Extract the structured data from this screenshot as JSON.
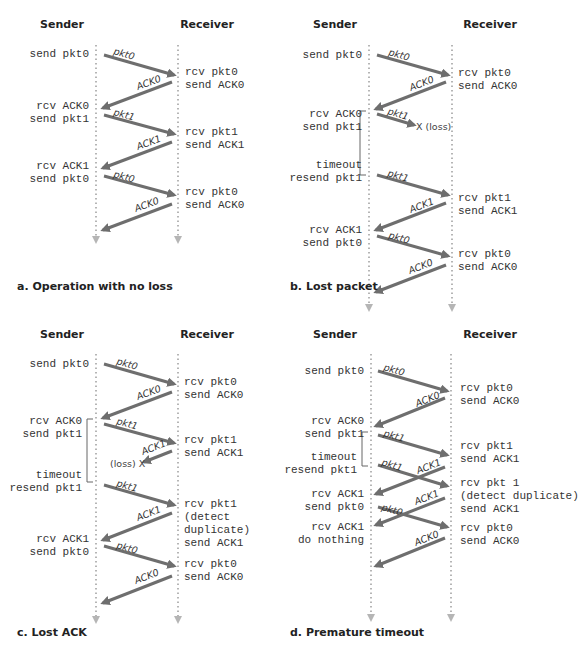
{
  "colors": {
    "arrow": "#6e6e6e",
    "timeline": "#b5b5b5",
    "text": "#333333"
  },
  "panels": [
    {
      "id": "a",
      "caption": "a. Operation with no loss",
      "sender_header": "Sender",
      "receiver_header": "Receiver",
      "header_pos": {
        "sender_x": 62,
        "receiver_x": 207,
        "y": 28
      },
      "timeline": {
        "sender_x": 96,
        "receiver_x": 178,
        "y1": 45,
        "y2": 240
      },
      "caption_pos": {
        "x": 17,
        "y": 290
      },
      "sender_events": [
        {
          "lines": [
            "send pkt0"
          ],
          "x": 89,
          "y": 57
        },
        {
          "lines": [
            "rcv ACK0",
            "send pkt1"
          ],
          "x": 89,
          "y": 109
        },
        {
          "lines": [
            "rcv ACK1",
            "send pkt0"
          ],
          "x": 89,
          "y": 169
        }
      ],
      "receiver_events": [
        {
          "lines": [
            "rcv pkt0",
            "send ACK0"
          ],
          "x": 185,
          "y": 75
        },
        {
          "lines": [
            "rcv pkt1",
            "send ACK1"
          ],
          "x": 185,
          "y": 135
        },
        {
          "lines": [
            "rcv pkt0",
            "send ACK0"
          ],
          "x": 185,
          "y": 195
        }
      ],
      "arrows": [
        {
          "label": "pkt0",
          "x1": 104,
          "y1": 55,
          "x2": 174,
          "y2": 75,
          "lx": 113,
          "ly": 54
        },
        {
          "label": "ACK0",
          "x1": 172,
          "y1": 82,
          "x2": 103,
          "y2": 108,
          "lx": 138,
          "ly": 90
        },
        {
          "label": "pkt1",
          "x1": 104,
          "y1": 115,
          "x2": 174,
          "y2": 134,
          "lx": 113,
          "ly": 115
        },
        {
          "label": "ACK1",
          "x1": 172,
          "y1": 142,
          "x2": 103,
          "y2": 168,
          "lx": 138,
          "ly": 150
        },
        {
          "label": "pkt0",
          "x1": 104,
          "y1": 176,
          "x2": 174,
          "y2": 195,
          "lx": 113,
          "ly": 177
        },
        {
          "label": "ACK0",
          "x1": 172,
          "y1": 204,
          "x2": 103,
          "y2": 230,
          "lx": 136,
          "ly": 212
        }
      ],
      "losses": [],
      "brackets": []
    },
    {
      "id": "b",
      "caption": "b. Lost packet",
      "sender_header": "Sender",
      "receiver_header": "Receiver",
      "header_pos": {
        "sender_x": 335,
        "receiver_x": 490,
        "y": 28
      },
      "timeline": {
        "sender_x": 369,
        "receiver_x": 452,
        "y1": 45,
        "y2": 308
      },
      "caption_pos": {
        "x": 290,
        "y": 290
      },
      "sender_events": [
        {
          "lines": [
            "send pkt0"
          ],
          "x": 362,
          "y": 58
        },
        {
          "lines": [
            "rcv ACK0",
            "send pkt1"
          ],
          "x": 362,
          "y": 117
        },
        {
          "lines": [
            "timeout",
            "resend pkt1"
          ],
          "x": 362,
          "y": 168
        },
        {
          "lines": [
            "rcv ACK1",
            "send pkt0"
          ],
          "x": 362,
          "y": 233
        }
      ],
      "receiver_events": [
        {
          "lines": [
            "rcv pkt0",
            "send ACK0"
          ],
          "x": 458,
          "y": 76
        },
        {
          "lines": [
            "rcv pkt1",
            "send ACK1"
          ],
          "x": 458,
          "y": 201
        },
        {
          "lines": [
            "rcv pkt0",
            "send ACK0"
          ],
          "x": 458,
          "y": 257
        }
      ],
      "arrows": [
        {
          "label": "pkt0",
          "x1": 377,
          "y1": 55,
          "x2": 448,
          "y2": 75,
          "lx": 388,
          "ly": 55
        },
        {
          "label": "ACK0",
          "x1": 446,
          "y1": 82,
          "x2": 376,
          "y2": 109,
          "lx": 411,
          "ly": 91
        },
        {
          "label": "pkt1",
          "x1": 377,
          "y1": 114,
          "x2": 414,
          "y2": 125,
          "lx": 387,
          "ly": 114
        },
        {
          "label": "pkt1",
          "x1": 377,
          "y1": 175,
          "x2": 448,
          "y2": 195,
          "lx": 387,
          "ly": 176
        },
        {
          "label": "ACK1",
          "x1": 446,
          "y1": 203,
          "x2": 376,
          "y2": 230,
          "lx": 411,
          "ly": 213
        },
        {
          "label": "pkt0",
          "x1": 377,
          "y1": 236,
          "x2": 448,
          "y2": 256,
          "lx": 388,
          "ly": 238
        },
        {
          "label": "ACK0",
          "x1": 446,
          "y1": 265,
          "x2": 376,
          "y2": 292,
          "lx": 410,
          "ly": 274
        }
      ],
      "losses": [
        {
          "text": "X (loss)",
          "x": 416,
          "y": 130
        }
      ],
      "brackets": [
        {
          "x": 360,
          "top": 111,
          "bottom": 175,
          "tick": 6
        }
      ]
    },
    {
      "id": "c",
      "caption": "c. Lost ACK",
      "sender_header": "Sender",
      "receiver_header": "Receiver",
      "header_pos": {
        "sender_x": 62,
        "receiver_x": 207,
        "y": 338
      },
      "timeline": {
        "sender_x": 96,
        "receiver_x": 178,
        "y1": 354,
        "y2": 620
      },
      "caption_pos": {
        "x": 17,
        "y": 636
      },
      "sender_events": [
        {
          "lines": [
            "send pkt0"
          ],
          "x": 89,
          "y": 367
        },
        {
          "lines": [
            "rcv ACK0",
            "send pkt1"
          ],
          "x": 82,
          "y": 424
        },
        {
          "lines": [
            "timeout",
            "resend pkt1"
          ],
          "x": 82,
          "y": 478
        },
        {
          "lines": [
            "rcv ACK1",
            "send pkt0"
          ],
          "x": 89,
          "y": 542
        }
      ],
      "receiver_events": [
        {
          "lines": [
            "rcv pkt0",
            "send ACK0"
          ],
          "x": 184,
          "y": 385
        },
        {
          "lines": [
            "rcv pkt1",
            "send ACK1"
          ],
          "x": 184,
          "y": 443
        },
        {
          "lines": [
            "rcv pkt1",
            "(detect",
            "duplicate)",
            "send ACK1"
          ],
          "x": 184,
          "y": 507
        },
        {
          "lines": [
            "rcv pkt0",
            "send ACK0"
          ],
          "x": 184,
          "y": 567
        }
      ],
      "arrows": [
        {
          "label": "pkt0",
          "x1": 104,
          "y1": 364,
          "x2": 174,
          "y2": 384,
          "lx": 116,
          "ly": 364
        },
        {
          "label": "ACK0",
          "x1": 172,
          "y1": 392,
          "x2": 103,
          "y2": 418,
          "lx": 138,
          "ly": 400
        },
        {
          "label": "pkt1",
          "x1": 104,
          "y1": 424,
          "x2": 174,
          "y2": 443,
          "lx": 116,
          "ly": 424
        },
        {
          "label": "ACK1",
          "x1": 172,
          "y1": 451,
          "x2": 144,
          "y2": 462,
          "lx": 143,
          "ly": 455
        },
        {
          "label": "pkt1",
          "x1": 104,
          "y1": 485,
          "x2": 174,
          "y2": 505,
          "lx": 116,
          "ly": 486
        },
        {
          "label": "ACK1",
          "x1": 172,
          "y1": 513,
          "x2": 103,
          "y2": 540,
          "lx": 138,
          "ly": 521
        },
        {
          "label": "pkt0",
          "x1": 104,
          "y1": 546,
          "x2": 174,
          "y2": 566,
          "lx": 116,
          "ly": 548
        },
        {
          "label": "ACK0",
          "x1": 172,
          "y1": 576,
          "x2": 103,
          "y2": 603,
          "lx": 136,
          "ly": 584
        }
      ],
      "losses": [
        {
          "text": "(loss) X",
          "x": 110,
          "y": 467
        }
      ],
      "brackets": [
        {
          "x": 87,
          "top": 419,
          "bottom": 482,
          "tick": 6
        }
      ]
    },
    {
      "id": "d",
      "caption": "d. Premature timeout",
      "sender_header": "Sender",
      "receiver_header": "Receiver",
      "header_pos": {
        "sender_x": 335,
        "receiver_x": 490,
        "y": 338
      },
      "timeline": {
        "sender_x": 371,
        "receiver_x": 451,
        "y1": 354,
        "y2": 618
      },
      "caption_pos": {
        "x": 290,
        "y": 636
      },
      "sender_events": [
        {
          "lines": [
            "send pkt0"
          ],
          "x": 364,
          "y": 374
        },
        {
          "lines": [
            "rcv ACK0",
            "send pkt1"
          ],
          "x": 364,
          "y": 424
        },
        {
          "lines": [
            "timeout",
            "resend pkt1"
          ],
          "x": 357,
          "y": 460
        },
        {
          "lines": [
            "rcv ACK1",
            "send pkt0"
          ],
          "x": 364,
          "y": 497
        },
        {
          "lines": [
            "rcv ACK1",
            "do nothing"
          ],
          "x": 364,
          "y": 530
        }
      ],
      "receiver_events": [
        {
          "lines": [
            "rcv pkt0",
            "send ACK0"
          ],
          "x": 460,
          "y": 391
        },
        {
          "lines": [
            "rcv pkt1",
            "send ACK1"
          ],
          "x": 460,
          "y": 449
        },
        {
          "lines": [
            "rcv pkt 1",
            "(detect duplicate)",
            "send ACK1"
          ],
          "x": 460,
          "y": 486
        },
        {
          "lines": [
            "rcv pkt0",
            "send ACK0"
          ],
          "x": 460,
          "y": 531
        }
      ],
      "arrows": [
        {
          "label": "pkt0",
          "x1": 378,
          "y1": 371,
          "x2": 447,
          "y2": 391,
          "lx": 383,
          "ly": 370
        },
        {
          "label": "ACK0",
          "x1": 445,
          "y1": 398,
          "x2": 376,
          "y2": 426,
          "lx": 417,
          "ly": 407
        },
        {
          "label": "pkt1",
          "x1": 378,
          "y1": 435,
          "x2": 447,
          "y2": 455,
          "lx": 383,
          "ly": 436
        },
        {
          "label": "pkt1",
          "x1": 378,
          "y1": 465,
          "x2": 447,
          "y2": 486,
          "lx": 381,
          "ly": 465
        },
        {
          "label": "ACK1",
          "x1": 445,
          "y1": 467,
          "x2": 376,
          "y2": 494,
          "lx": 418,
          "ly": 474
        },
        {
          "label": "pkt0",
          "x1": 378,
          "y1": 507,
          "x2": 447,
          "y2": 527,
          "lx": 381,
          "ly": 510
        },
        {
          "label": "ACK1",
          "x1": 445,
          "y1": 498,
          "x2": 376,
          "y2": 525,
          "lx": 416,
          "ly": 505
        },
        {
          "label": "ACK0",
          "x1": 445,
          "y1": 538,
          "x2": 376,
          "y2": 566,
          "lx": 416,
          "ly": 546
        }
      ],
      "losses": [],
      "brackets": [
        {
          "x": 362,
          "top": 432,
          "bottom": 466,
          "tick": 6
        }
      ]
    }
  ]
}
